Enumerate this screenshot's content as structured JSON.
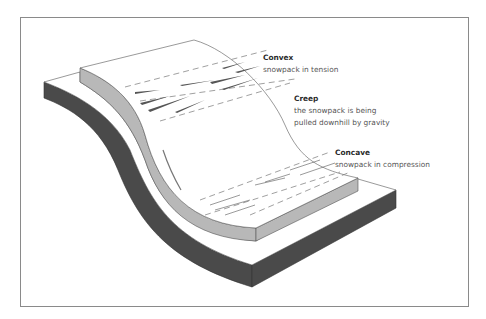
{
  "diagram": {
    "type": "slope snowpack stress cross-section",
    "colors": {
      "ground_side": "#4a4a4a",
      "snowpack_side": "#b8b8b8",
      "surface": "#ffffff",
      "outline": "#555555",
      "frame": "#8a8a8a",
      "text_title": "#2a2a2a",
      "text_body": "#555555"
    },
    "labels": {
      "convex": {
        "title": "Convex",
        "desc": "snowpack in tension"
      },
      "creep": {
        "title": "Creep",
        "desc_line1": "the snowpack is being",
        "desc_line2": "pulled downhill by gravity"
      },
      "concave": {
        "title": "Concave",
        "desc": "snowpack in compression"
      }
    }
  }
}
